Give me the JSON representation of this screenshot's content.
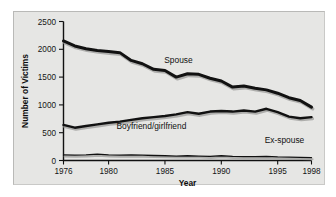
{
  "chart_data": {
    "type": "line",
    "title": "",
    "xlabel": "Year",
    "ylabel": "Number of Victims",
    "xlim": [
      1976,
      1998
    ],
    "ylim": [
      0,
      2500
    ],
    "yticks": [
      0,
      500,
      1000,
      1500,
      2000,
      2500
    ],
    "ytick_labels": [
      "0",
      "500",
      "1000",
      "1500",
      "2000",
      "2500"
    ],
    "xticks": [
      1976,
      1980,
      1985,
      1990,
      1995,
      1998
    ],
    "xtick_labels": [
      "1976",
      "1980",
      "1985",
      "1990",
      "1995",
      "1998"
    ],
    "grid": false,
    "legend": "inline-annotations",
    "x": [
      1976,
      1977,
      1978,
      1979,
      1980,
      1981,
      1982,
      1983,
      1984,
      1985,
      1986,
      1987,
      1988,
      1989,
      1990,
      1991,
      1992,
      1993,
      1994,
      1995,
      1996,
      1997,
      1998
    ],
    "series": [
      {
        "name": "Spouse",
        "label": "Spouse",
        "color": "#111111",
        "values": [
          2150,
          2060,
          2010,
          1980,
          1960,
          1940,
          1800,
          1740,
          1640,
          1620,
          1500,
          1560,
          1550,
          1480,
          1430,
          1320,
          1340,
          1300,
          1270,
          1210,
          1130,
          1080,
          960
        ]
      },
      {
        "name": "Boyfriend/girlfriend",
        "label": "Boyfriend/girlfriend",
        "color": "#111111",
        "values": [
          640,
          590,
          620,
          650,
          680,
          700,
          730,
          760,
          780,
          800,
          830,
          870,
          840,
          880,
          890,
          880,
          900,
          880,
          930,
          870,
          790,
          760,
          780
        ]
      },
      {
        "name": "Ex-spouse",
        "label": "Ex-spouse",
        "color": "#111111",
        "values": [
          100,
          95,
          100,
          115,
          100,
          95,
          100,
          95,
          90,
          85,
          80,
          85,
          80,
          75,
          85,
          75,
          70,
          70,
          75,
          65,
          60,
          55,
          50
        ]
      }
    ],
    "annotations": [
      {
        "text": "Spouse",
        "x": 1986.2,
        "y": 1760
      },
      {
        "text": "Boyfriend/girlfriend",
        "x": 1983.8,
        "y": 560
      },
      {
        "text": "Ex-spouse",
        "x": 1995.6,
        "y": 310
      }
    ],
    "colors": {
      "background": "#e6e6e4",
      "page": "#ffffff",
      "axis": "#111111",
      "line": "#111111",
      "shadow": "#9b9b99"
    }
  }
}
